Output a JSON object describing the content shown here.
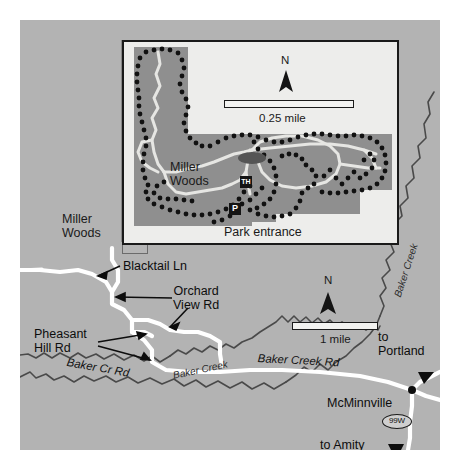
{
  "map": {
    "title": "Miller Woods area map",
    "colors": {
      "land": "#b3b3b3",
      "inset_background": "#ededeb",
      "park_polygon": "#8f8f8f",
      "road": "#ffffff",
      "stream": "#4d4d4d",
      "trail_dot": "#111111",
      "frame": "#1a1a1a"
    },
    "regional": {
      "north_label": "N",
      "scale_label": "1 mile",
      "labels": {
        "miller_woods": "Miller\nWoods",
        "blacktail_ln": "Blacktail Ln",
        "orchard_view_rd": "Orchard\nView Rd",
        "pheasant_hill_rd": "Pheasant\nHill Rd",
        "baker_cr_rd": "Baker Cr Rd",
        "baker_creek_rd": "Baker Creek Rd",
        "baker_creek_stream": "Baker Creek",
        "baker_creek_stream_right": "Baker Creek",
        "to_portland": "to\nPortland",
        "to_amity": "to Amity",
        "mcminnville": "McMinnville",
        "route_shield": "99W"
      }
    },
    "inset": {
      "north_label": "N",
      "scale_label": "0.25 mile",
      "labels": {
        "miller_woods": "Miller\nWoods",
        "park_entrance": "Park entrance"
      },
      "symbols": {
        "trailhead": "TH",
        "parking": "P"
      }
    }
  }
}
